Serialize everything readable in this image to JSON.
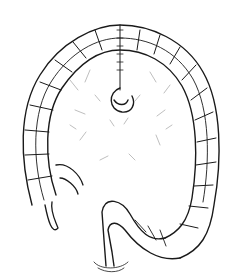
{
  "image": {
    "subject": "colon-line-art-illustration",
    "background": "#ffffff",
    "ink": "#1a1a1a"
  }
}
